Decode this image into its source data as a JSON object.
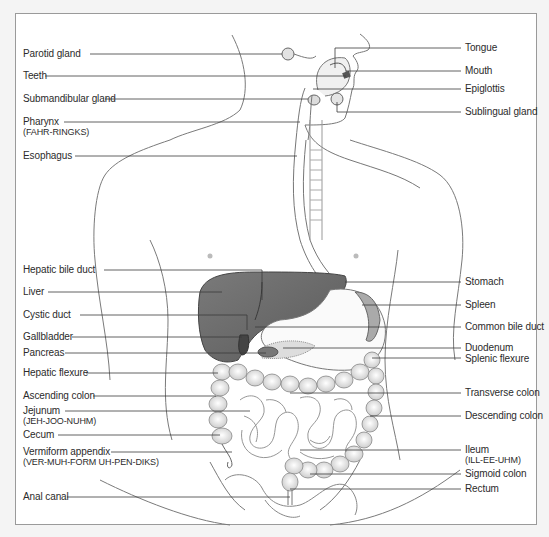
{
  "diagram": {
    "colors": {
      "background": "#f4f4f4",
      "frame_fill": "#ffffff",
      "frame_border": "#9a9a9a",
      "leader_line": "#3a3a3a",
      "label_text": "#2b2b2b",
      "liver_fill": "#6d6d6d",
      "organ_line": "#555555"
    },
    "left_labels": [
      {
        "id": "parotid-gland",
        "label": "Parotid gland",
        "pronunciation": null,
        "y": 54
      },
      {
        "id": "teeth",
        "label": "Teeth",
        "pronunciation": null,
        "y": 76
      },
      {
        "id": "submandibular-gland",
        "label": "Submandibular gland",
        "pronunciation": null,
        "y": 99
      },
      {
        "id": "pharynx",
        "label": "Pharynx",
        "pronunciation": "(FAHR-RINGKS)",
        "y": 122
      },
      {
        "id": "esophagus",
        "label": "Esophagus",
        "pronunciation": null,
        "y": 156
      },
      {
        "id": "hepatic-bile-duct",
        "label": "Hepatic bile duct",
        "pronunciation": null,
        "y": 270
      },
      {
        "id": "liver",
        "label": "Liver",
        "pronunciation": null,
        "y": 292
      },
      {
        "id": "cystic-duct",
        "label": "Cystic duct",
        "pronunciation": null,
        "y": 315
      },
      {
        "id": "gallbladder",
        "label": "Gallbladder",
        "pronunciation": null,
        "y": 337
      },
      {
        "id": "pancreas",
        "label": "Pancreas",
        "pronunciation": null,
        "y": 353
      },
      {
        "id": "hepatic-flexure",
        "label": "Hepatic flexure",
        "pronunciation": null,
        "y": 373
      },
      {
        "id": "ascending-colon",
        "label": "Ascending colon",
        "pronunciation": null,
        "y": 396
      },
      {
        "id": "jejunum",
        "label": "Jejunum",
        "pronunciation": "(JEH-JOO-NUHM)",
        "y": 411
      },
      {
        "id": "cecum",
        "label": "Cecum",
        "pronunciation": null,
        "y": 435
      },
      {
        "id": "vermiform-appendix",
        "label": "Vermiform appendix",
        "pronunciation": "(VER-MUH-FORM UH-PEN-DIKS)",
        "y": 452
      },
      {
        "id": "anal-canal",
        "label": "Anal canal",
        "pronunciation": null,
        "y": 497
      }
    ],
    "right_labels": [
      {
        "id": "tongue",
        "label": "Tongue",
        "pronunciation": null,
        "y": 48
      },
      {
        "id": "mouth",
        "label": "Mouth",
        "pronunciation": null,
        "y": 71
      },
      {
        "id": "epiglottis",
        "label": "Epiglottis",
        "pronunciation": null,
        "y": 89
      },
      {
        "id": "sublingual-gland",
        "label": "Sublingual gland",
        "pronunciation": null,
        "y": 112
      },
      {
        "id": "stomach",
        "label": "Stomach",
        "pronunciation": null,
        "y": 282
      },
      {
        "id": "spleen",
        "label": "Spleen",
        "pronunciation": null,
        "y": 305
      },
      {
        "id": "common-bile-duct",
        "label": "Common bile duct",
        "pronunciation": null,
        "y": 327
      },
      {
        "id": "duodenum",
        "label": "Duodenum",
        "pronunciation": null,
        "y": 348
      },
      {
        "id": "splenic-flexure",
        "label": "Splenic flexure",
        "pronunciation": null,
        "y": 358
      },
      {
        "id": "transverse-colon",
        "label": "Transverse colon",
        "pronunciation": null,
        "y": 393
      },
      {
        "id": "descending-colon",
        "label": "Descending colon",
        "pronunciation": null,
        "y": 416
      },
      {
        "id": "ileum",
        "label": "Ileum",
        "pronunciation": "(ILL-EE-UHM)",
        "y": 450
      },
      {
        "id": "sigmoid-colon",
        "label": "Sigmoid colon",
        "pronunciation": null,
        "y": 474
      },
      {
        "id": "rectum",
        "label": "Rectum",
        "pronunciation": null,
        "y": 489
      }
    ]
  }
}
